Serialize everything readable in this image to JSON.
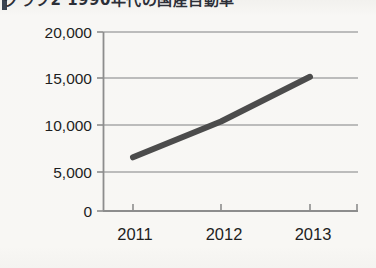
{
  "page": {
    "background_color": "#f7f6f3",
    "clipped_heading": "グラフ2 1990年代の国産自動車",
    "clipped_heading_note": "partially cropped at top edge of scan"
  },
  "chart_data": {
    "type": "line",
    "title": "",
    "xlabel": "",
    "ylabel": "",
    "categories": [
      "2011",
      "2012",
      "2013"
    ],
    "x": [
      2011,
      2012,
      2013
    ],
    "values": [
      6000,
      10000,
      15000
    ],
    "series": [
      {
        "name": "series-1",
        "values": [
          6000,
          10000,
          15000
        ]
      }
    ],
    "ylim": [
      0,
      20000
    ],
    "ytick_labels": [
      "20,000",
      "15,000",
      "10,000",
      "5,000",
      "0"
    ],
    "ytick_values": [
      20000,
      15000,
      10000,
      5000,
      0
    ],
    "xtick_labels": [
      "2011",
      "2012",
      "2013"
    ],
    "grid": true,
    "grid_axis": "y",
    "legend": false,
    "legend_position": "none",
    "line_color": "#4c4c4c",
    "line_width": 6,
    "axis_color": "#8d8d8d",
    "grid_color": "#a9a9a9",
    "text_color": "#1e1e1e",
    "markers": false,
    "annotations": []
  }
}
